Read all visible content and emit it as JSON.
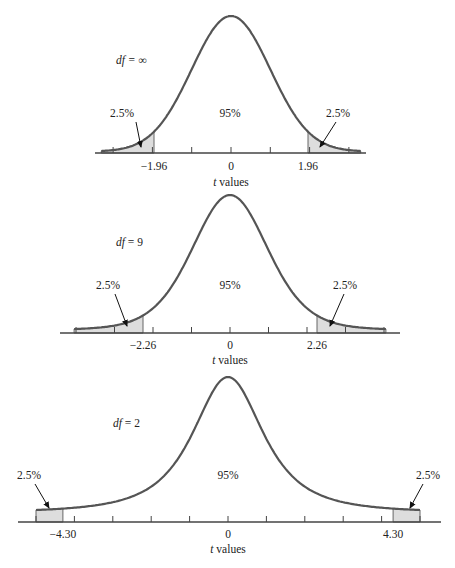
{
  "chart_data": [
    {
      "type": "area",
      "title": "df = ∞",
      "df_label": "df",
      "df_value": "∞",
      "df": null,
      "xlabel": "t values",
      "xlabel_var": "t",
      "xlabel_rest": " values",
      "center_label": "95%",
      "tail_label_left": "2.5%",
      "tail_label_right": "2.5%",
      "critical_value": 1.96,
      "tick_labels": [
        "−1.96",
        "0",
        "1.96"
      ],
      "x_range": [
        -3.3,
        3.3
      ],
      "shaded_regions": [
        [
          -3.3,
          -1.96
        ],
        [
          1.96,
          3.3
        ]
      ],
      "areas": {
        "left_tail": 2.5,
        "center": 95,
        "right_tail": 2.5
      }
    },
    {
      "type": "area",
      "title": "df = 9",
      "df_label": "df",
      "df_value": "9",
      "df": 9,
      "xlabel": "t values",
      "xlabel_var": "t",
      "xlabel_rest": " values",
      "center_label": "95%",
      "tail_label_left": "2.5%",
      "tail_label_right": "2.5%",
      "critical_value": 2.26,
      "tick_labels": [
        "−2.26",
        "0",
        "2.26"
      ],
      "x_range": [
        -4.05,
        4.05
      ],
      "shaded_regions": [
        [
          -4.05,
          -2.26
        ],
        [
          2.26,
          4.05
        ]
      ],
      "areas": {
        "left_tail": 2.5,
        "center": 95,
        "right_tail": 2.5
      }
    },
    {
      "type": "area",
      "title": "df = 2",
      "df_label": "df",
      "df_value": "2",
      "df": 2,
      "xlabel": "t values",
      "xlabel_var": "t",
      "xlabel_rest": " values",
      "center_label": "95%",
      "tail_label_left": "2.5%",
      "tail_label_right": "2.5%",
      "critical_value": 4.3,
      "tick_labels": [
        "−4.30",
        "0",
        "4.30"
      ],
      "x_range": [
        -5.0,
        5.0
      ],
      "shaded_regions": [
        [
          -5.0,
          -4.3
        ],
        [
          4.3,
          5.0
        ]
      ],
      "areas": {
        "left_tail": 2.5,
        "center": 95,
        "right_tail": 2.5
      }
    }
  ],
  "style": {
    "curve_color": "#555555",
    "shade_color": "#dddddd",
    "axis_color": "#444444",
    "text_color": "#222222"
  },
  "layout": [
    {
      "cx": 231,
      "base": 153,
      "peak": 16,
      "ppu": 39.3,
      "floor": 2,
      "axis": [
        95,
        366
      ],
      "ticks": [
        -3,
        -2,
        -1,
        0,
        1,
        2,
        3
      ],
      "df_pos": [
        116,
        64
      ],
      "center_pos": [
        230,
        117
      ],
      "tl_pos": [
        122,
        117
      ],
      "tr_pos": [
        338,
        117
      ],
      "arrow_l": [
        [
          136,
          122
        ],
        [
          141,
          147
        ]
      ],
      "arrow_r": [
        [
          336,
          122
        ],
        [
          320,
          147
        ]
      ],
      "tick_label_y": 170,
      "xlabel_y": 186
    },
    {
      "cx": 230,
      "base": 333,
      "peak": 195,
      "ppu": 38.5,
      "floor": 4,
      "axis": [
        60,
        400
      ],
      "ticks": [
        -4,
        -3,
        -2,
        -1,
        0,
        1,
        2,
        3,
        4
      ],
      "df_pos": [
        116,
        246
      ],
      "center_pos": [
        230,
        289
      ],
      "tl_pos": [
        108,
        289
      ],
      "tr_pos": [
        345,
        289
      ],
      "arrow_l": [
        [
          115,
          294
        ],
        [
          127,
          326
        ]
      ],
      "arrow_r": [
        [
          344,
          294
        ],
        [
          330,
          326
        ]
      ],
      "tick_label_y": 349,
      "xlabel_y": 364
    },
    {
      "cx": 228,
      "base": 522,
      "peak": 377,
      "ppu": 38.4,
      "floor": 12,
      "axis": [
        18,
        441
      ],
      "ticks": [
        -5,
        -4,
        -3,
        -2,
        -1,
        0,
        1,
        2,
        3,
        4,
        5
      ],
      "df_pos": [
        113,
        427
      ],
      "center_pos": [
        228,
        479
      ],
      "tl_pos": [
        29,
        479
      ],
      "tr_pos": [
        428,
        479
      ],
      "arrow_l": [
        [
          35,
          484
        ],
        [
          49,
          508
        ]
      ],
      "arrow_r": [
        [
          423,
          484
        ],
        [
          410,
          508
        ]
      ],
      "tick_label_y": 538,
      "xlabel_y": 553
    }
  ]
}
